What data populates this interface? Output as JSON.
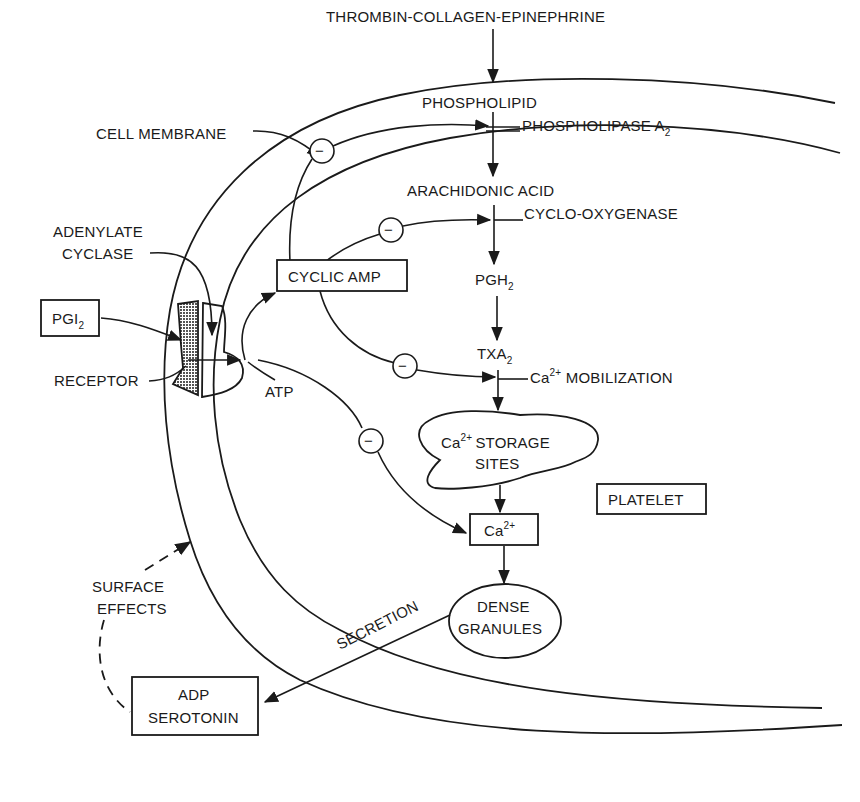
{
  "diagram": {
    "labels": {
      "agonists": "THROMBIN-COLLAGEN-EPINEPHRINE",
      "phospholipid": "PHOSPHOLIPID",
      "phospholipase": "PHOSPHOLIPASE A",
      "phospholipase_sub": "2",
      "cell_membrane": "CELL MEMBRANE",
      "arachidonic_acid": "ARACHIDONIC ACID",
      "cyclooxygenase": "CYCLO-OXYGENASE",
      "adenylate_line1": "ADENYLATE",
      "adenylate_line2": "CYCLASE",
      "cyclic_amp": "CYCLIC AMP",
      "pgh": "PGH",
      "pgh_sub": "2",
      "pgi": "PGI",
      "pgi_sub": "2",
      "txa": "TXA",
      "txa_sub": "2",
      "ca_mob_prefix": "Ca",
      "ca_mob_sup": "2+",
      "ca_mob_text": " MOBILIZATION",
      "receptor": "RECEPTOR",
      "atp": "ATP",
      "storage_prefix": "Ca",
      "storage_sup": "2+",
      "storage_line1": "STORAGE",
      "storage_line2": "SITES",
      "platelet": "PLATELET",
      "ca_box": "Ca",
      "ca_box_sup": "2+",
      "surface_line1": "SURFACE",
      "surface_line2": "EFFECTS",
      "dense_line1": "DENSE",
      "dense_line2": "GRANULES",
      "secretion": "SECRETION",
      "adp_line1": "ADP",
      "adp_line2": "SEROTONIN",
      "inhibit_symbol": "−"
    },
    "colors": {
      "ink": "#1a1a1a",
      "background": "#ffffff"
    }
  }
}
